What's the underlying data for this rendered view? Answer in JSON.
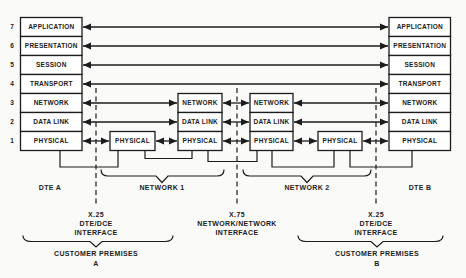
{
  "colors": {
    "ink": "#1c1c1c",
    "paper": "#fafaf8"
  },
  "stacks": {
    "dte_a": {
      "label": "DTE A",
      "layers": [
        {
          "num": "7",
          "name": "APPLICATION"
        },
        {
          "num": "6",
          "name": "PRESENTATION"
        },
        {
          "num": "5",
          "name": "SESSION"
        },
        {
          "num": "4",
          "name": "TRANSPORT"
        },
        {
          "num": "3",
          "name": "NETWORK"
        },
        {
          "num": "2",
          "name": "DATA LINK"
        },
        {
          "num": "1",
          "name": "PHYSICAL"
        }
      ]
    },
    "dte_b": {
      "label": "DTE B",
      "layers": [
        "APPLICATION",
        "PRESENTATION",
        "SESSION",
        "TRANSPORT",
        "NETWORK",
        "DATA LINK",
        "PHYSICAL"
      ]
    },
    "node1": {
      "layers": [
        "NETWORK",
        "DATA LINK",
        "PHYSICAL"
      ]
    },
    "node2": {
      "layers": [
        "NETWORK",
        "DATA LINK",
        "PHYSICAL"
      ]
    },
    "dce_a": {
      "label": "PHYSICAL"
    },
    "dce_b": {
      "label": "PHYSICAL"
    }
  },
  "braces": {
    "network1": "NETWORK 1",
    "network2": "NETWORK 2",
    "premises_a": {
      "line1": "CUSTOMER PREMISES",
      "line2": "A"
    },
    "premises_b": {
      "line1": "CUSTOMER PREMISES",
      "line2": "B"
    }
  },
  "interfaces": {
    "x25_a": {
      "line1": "X.25",
      "line2": "DTE/DCE",
      "line3": "INTERFACE"
    },
    "x75": {
      "line1": "X.75",
      "line2": "NETWORK/NETWORK",
      "line3": "INTERFACE"
    },
    "x25_b": {
      "line1": "X.25",
      "line2": "DTE/DCE",
      "line3": "INTERFACE"
    }
  }
}
